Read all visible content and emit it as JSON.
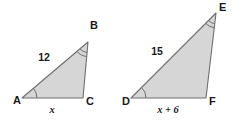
{
  "figure": {
    "background_color": "#ffffff",
    "fill_color": "#d6d6d6",
    "stroke_color": "#6e6e6e",
    "label_color": "#1a1a1a"
  },
  "triangles": [
    {
      "name": "triangle-abc",
      "vertices": [
        {
          "label": "A",
          "x": 22,
          "y": 98,
          "label_x": 13,
          "label_y": 104,
          "angle_mark": "single-arc"
        },
        {
          "label": "B",
          "x": 88,
          "y": 42,
          "label_x": 90,
          "label_y": 29,
          "angle_mark": "double-arc"
        },
        {
          "label": "C",
          "x": 83,
          "y": 98,
          "label_x": 86,
          "label_y": 105,
          "angle_mark": "none"
        }
      ],
      "sides": [
        {
          "name": "side-ab",
          "label": "12",
          "style": "upright",
          "label_x": 44,
          "label_y": 61
        },
        {
          "name": "side-ac",
          "label": "x",
          "style": "italic",
          "label_x": 52,
          "label_y": 113
        }
      ]
    },
    {
      "name": "triangle-def",
      "vertices": [
        {
          "label": "D",
          "x": 131,
          "y": 98,
          "label_x": 122,
          "label_y": 105,
          "angle_mark": "single-arc"
        },
        {
          "label": "E",
          "x": 216,
          "y": 13,
          "label_x": 219,
          "label_y": 11,
          "angle_mark": "double-arc"
        },
        {
          "label": "F",
          "x": 206,
          "y": 98,
          "label_x": 209,
          "label_y": 105,
          "angle_mark": "none"
        }
      ],
      "sides": [
        {
          "name": "side-de",
          "label": "15",
          "style": "upright",
          "label_x": 157,
          "label_y": 55
        },
        {
          "name": "side-df",
          "label": "x + 6",
          "style": "italic",
          "label_x": 155,
          "label_y": 113
        }
      ]
    }
  ]
}
